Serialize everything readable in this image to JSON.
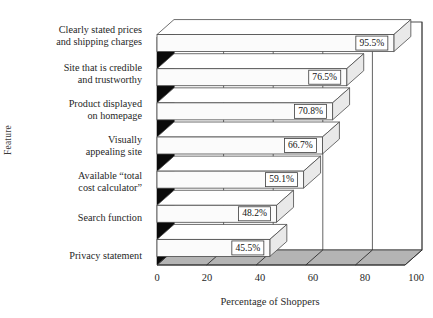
{
  "chart_data": {
    "type": "bar",
    "orientation": "horizontal",
    "style": "3d-bar",
    "title": "",
    "xlabel": "Percentage of Shoppers",
    "ylabel": "Feature",
    "xlim": [
      0,
      100
    ],
    "xticks": [
      "0",
      "20",
      "40",
      "60",
      "80",
      "100"
    ],
    "xtick_values": [
      0,
      20,
      40,
      60,
      80,
      100
    ],
    "grid": true,
    "legend": false,
    "categories": [
      "Clearly stated prices\nand shipping charges",
      "Site that is credible\nand trustworthy",
      "Product displayed\non homepage",
      "Visually\nappealing site",
      "Available “total\ncost calculator”",
      "Search function",
      "Privacy statement"
    ],
    "values": [
      95.5,
      76.5,
      70.8,
      66.7,
      59.1,
      48.2,
      45.5
    ],
    "data_labels": [
      "95.5%",
      "76.5%",
      "70.8%",
      "66.7%",
      "59.1%",
      "48.2%",
      "45.5%"
    ],
    "colors": {
      "bar_face": "#fbfbfb",
      "bar_top": "#ffffff",
      "bar_cap": "#e9e9e9",
      "side_wall": "#0a0a0a",
      "floor": "#b4b4b4",
      "back_wall": "#ffffff",
      "outline": "#3c3c3c",
      "text": "#1a1a1a"
    }
  },
  "categories_display": [
    {
      "line1": "Clearly stated prices",
      "line2": "and shipping charges"
    },
    {
      "line1": "Site that is credible",
      "line2": "and trustworthy"
    },
    {
      "line1": "Product displayed",
      "line2": "on homepage"
    },
    {
      "line1": "Visually",
      "line2": "appealing site"
    },
    {
      "line1": "Available “total",
      "line2": "cost calculator”"
    },
    {
      "line1": "Search function",
      "line2": ""
    },
    {
      "line1": "Privacy statement",
      "line2": ""
    }
  ],
  "axes": {
    "x_title": "Percentage of Shoppers",
    "y_title": "Feature",
    "x_ticks": [
      "0",
      "20",
      "40",
      "60",
      "80",
      "100"
    ]
  }
}
